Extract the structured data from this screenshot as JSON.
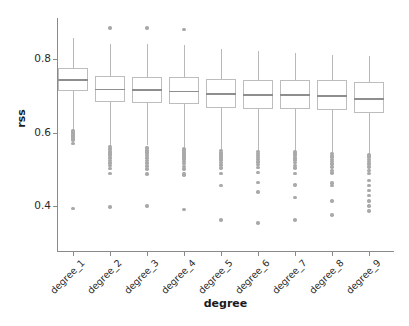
{
  "chart_data": {
    "type": "box",
    "title": "",
    "xlabel": "degree",
    "ylabel": "rss",
    "categories": [
      "degree_1",
      "degree_2",
      "degree_3",
      "degree_4",
      "degree_5",
      "degree_6",
      "degree_7",
      "degree_8",
      "degree_9"
    ],
    "ylim": [
      0.33,
      0.9
    ],
    "yticks": [
      0.4,
      0.6,
      0.8
    ],
    "ytick_labels": [
      "0.4",
      "0.6",
      "0.8"
    ],
    "grid": false,
    "legend": null,
    "colors": {
      "box_edge": "#bdbdbd",
      "median": "#8e8e8e",
      "whisker": "#b8b8b8",
      "outlier": "#a9a9a9",
      "axis": "#8a8a8a",
      "text": "#1a1a1a",
      "background": "#ffffff"
    },
    "boxes": [
      {
        "category": "degree_1",
        "whisker_low": 0.607,
        "q1": 0.713,
        "median": 0.745,
        "q3": 0.775,
        "whisker_high": 0.856,
        "outliers": [
          0.605,
          0.601,
          0.597,
          0.593,
          0.59,
          0.586,
          0.583,
          0.58,
          0.57,
          0.393
        ]
      },
      {
        "category": "degree_2",
        "whisker_low": 0.565,
        "q1": 0.682,
        "median": 0.719,
        "q3": 0.754,
        "whisker_high": 0.841,
        "outliers": [
          0.884,
          0.562,
          0.557,
          0.553,
          0.549,
          0.545,
          0.541,
          0.537,
          0.531,
          0.524,
          0.517,
          0.51,
          0.502,
          0.489,
          0.397
        ]
      },
      {
        "category": "degree_3",
        "whisker_low": 0.565,
        "q1": 0.681,
        "median": 0.718,
        "q3": 0.752,
        "whisker_high": 0.841,
        "outliers": [
          0.884,
          0.56,
          0.556,
          0.551,
          0.547,
          0.543,
          0.538,
          0.531,
          0.524,
          0.517,
          0.509,
          0.501,
          0.487,
          0.4
        ]
      },
      {
        "category": "degree_4",
        "whisker_low": 0.56,
        "q1": 0.678,
        "median": 0.714,
        "q3": 0.75,
        "whisker_high": 0.838,
        "outliers": [
          0.881,
          0.555,
          0.551,
          0.547,
          0.543,
          0.539,
          0.535,
          0.531,
          0.526,
          0.521,
          0.515,
          0.508,
          0.501,
          0.488,
          0.484,
          0.39
        ]
      },
      {
        "category": "degree_5",
        "whisker_low": 0.555,
        "q1": 0.667,
        "median": 0.707,
        "q3": 0.745,
        "whisker_high": 0.827,
        "outliers": [
          0.551,
          0.546,
          0.541,
          0.536,
          0.531,
          0.525,
          0.519,
          0.512,
          0.503,
          0.488,
          0.456,
          0.362
        ]
      },
      {
        "category": "degree_6",
        "whisker_low": 0.553,
        "q1": 0.665,
        "median": 0.705,
        "q3": 0.744,
        "whisker_high": 0.822,
        "outliers": [
          0.548,
          0.543,
          0.538,
          0.532,
          0.526,
          0.52,
          0.513,
          0.505,
          0.491,
          0.464,
          0.438,
          0.354
        ]
      },
      {
        "category": "degree_7",
        "whisker_low": 0.551,
        "q1": 0.664,
        "median": 0.705,
        "q3": 0.744,
        "whisker_high": 0.817,
        "outliers": [
          0.547,
          0.542,
          0.537,
          0.531,
          0.525,
          0.518,
          0.511,
          0.503,
          0.489,
          0.457,
          0.423,
          0.362
        ]
      },
      {
        "category": "degree_8",
        "whisker_low": 0.548,
        "q1": 0.66,
        "median": 0.702,
        "q3": 0.742,
        "whisker_high": 0.811,
        "outliers": [
          0.543,
          0.538,
          0.533,
          0.527,
          0.521,
          0.514,
          0.506,
          0.497,
          0.49,
          0.463,
          0.455,
          0.414,
          0.375
        ]
      },
      {
        "category": "degree_9",
        "whisker_low": 0.545,
        "q1": 0.652,
        "median": 0.694,
        "q3": 0.738,
        "whisker_high": 0.807,
        "outliers": [
          0.539,
          0.533,
          0.527,
          0.521,
          0.514,
          0.506,
          0.497,
          0.488,
          0.47,
          0.456,
          0.442,
          0.429,
          0.414,
          0.4,
          0.386
        ]
      }
    ]
  },
  "geometry": {
    "plot_left": 57,
    "plot_right": 394,
    "plot_top": 18,
    "plot_bottom": 251,
    "box_width": 30,
    "y_for_0_8": 59,
    "y_for_0_4": 206
  }
}
